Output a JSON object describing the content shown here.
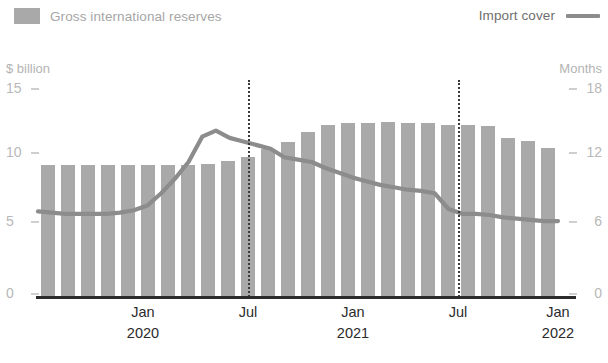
{
  "legend": {
    "series_bar_label": "Gross international reserves",
    "series_line_label": "Import cover",
    "bar_color": "#a9a9a9",
    "line_color": "#8c8c8c"
  },
  "axes": {
    "left_unit": "$ billion",
    "right_unit": "Months",
    "left_ticks": [
      "15",
      "10",
      "5",
      "0"
    ],
    "right_ticks": [
      "18",
      "12",
      "6",
      "0"
    ],
    "x_labels": [
      {
        "month": "Jan",
        "year": "2020"
      },
      {
        "month": "Jul",
        "year": ""
      },
      {
        "month": "Jan",
        "year": "2021"
      },
      {
        "month": "Jul",
        "year": ""
      },
      {
        "month": "Jan",
        "year": "2022"
      }
    ]
  },
  "chart_data": {
    "type": "bar",
    "title": "",
    "xlabel": "",
    "ylabel": "$ billion",
    "y2label": "Months",
    "ylim": [
      0,
      15
    ],
    "y2lim": [
      0,
      18
    ],
    "grid": false,
    "legend_position": "top",
    "categories": [
      "Jan 2020",
      "Feb 2020",
      "Mar 2020",
      "Apr 2020",
      "May 2020",
      "Jun 2020",
      "Jul 2020",
      "Aug 2020",
      "Sep 2020",
      "Oct 2020",
      "Nov 2020",
      "Dec 2020",
      "Jan 2021",
      "Feb 2021",
      "Mar 2021",
      "Apr 2021",
      "May 2021",
      "Jun 2021",
      "Jul 2021",
      "Aug 2021",
      "Sep 2021",
      "Oct 2021",
      "Nov 2021",
      "Dec 2021",
      "Jan 2022",
      "Feb 2022"
    ],
    "series": [
      {
        "name": "Gross international reserves",
        "axis": "left",
        "unit": "$ billion",
        "type": "bar",
        "color": "#a9a9a9",
        "values": [
          9.1,
          9.1,
          9.1,
          9.1,
          9.1,
          9.1,
          9.1,
          9.1,
          9.2,
          9.4,
          9.7,
          10.2,
          10.7,
          11.4,
          11.9,
          12.0,
          12.0,
          12.1,
          12.0,
          12.0,
          11.9,
          11.9,
          11.8,
          11.0,
          10.8,
          10.3
        ]
      },
      {
        "name": "Import cover",
        "axis": "right",
        "unit": "Months",
        "type": "line",
        "color": "#8c8c8c",
        "values": [
          7.1,
          7.0,
          6.9,
          6.9,
          6.9,
          6.9,
          7.0,
          7.2,
          7.6,
          8.6,
          9.8,
          11.2,
          12.2,
          13.1,
          13.8,
          13.4,
          13.0,
          12.6,
          12.2,
          11.8,
          11.2,
          10.6,
          10.0,
          9.4,
          8.7,
          8.6
        ]
      }
    ],
    "annotations": [
      {
        "type": "vertical-dotted-line",
        "at": "Jul 2021",
        "index": 10.7
      },
      {
        "type": "vertical-dotted-line",
        "at": "Jul 2021",
        "index": 21.4
      }
    ]
  },
  "extended_line": {
    "values": [
      7.1,
      7.0,
      6.9,
      6.9,
      6.9,
      6.9,
      7.0,
      7.2,
      7.6,
      8.6,
      9.8,
      11.2,
      13.3,
      13.8,
      13.2,
      12.9,
      12.6,
      12.3,
      11.6,
      11.4,
      11.2,
      10.7,
      10.3,
      9.9,
      9.6,
      9.3,
      9.1,
      8.9,
      8.8,
      8.6,
      7.3,
      6.9,
      6.9,
      6.8,
      6.6,
      6.5,
      6.4,
      6.3,
      6.3
    ]
  }
}
